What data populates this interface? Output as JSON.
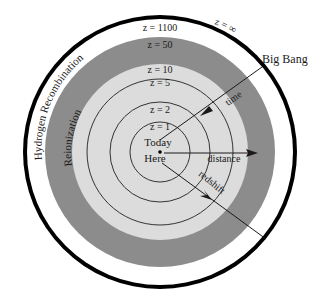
{
  "diagram": {
    "center_labels": {
      "line1": "Today",
      "line2": "Here"
    },
    "ring_labels": {
      "z1": "z = 1",
      "z2": "z = 2",
      "z5": "z = 5",
      "z10": "z = 10",
      "z50": "z = 50",
      "z1100": "z = 1100",
      "zinf": "z = ∞"
    },
    "band_labels": {
      "reionization": "Reionization",
      "recombination": "Hydrogen Recombination"
    },
    "arrow_labels": {
      "time": "time",
      "distance": "distance",
      "redshift": "redshift"
    },
    "callout": "Big Bang",
    "colors": {
      "outer_ring": "#000000",
      "white_band": "#ffffff",
      "reionization_band": "#8c8c8c",
      "inner_disk": "#dcdcdc",
      "lines": "#1a1a1a"
    }
  }
}
